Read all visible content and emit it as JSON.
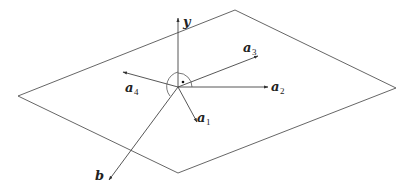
{
  "diagram": {
    "type": "vector-plane-diagram",
    "colors": {
      "line": "#444444",
      "plane": "#555555",
      "text": "#222222"
    },
    "plane": {
      "corners": [
        [
          235,
          10
        ],
        [
          396,
          88
        ],
        [
          178,
          173
        ],
        [
          18,
          96
        ]
      ]
    },
    "origin": [
      178,
      87
    ],
    "vectors": [
      {
        "id": "y",
        "name": "y",
        "subscript": "",
        "end": [
          178,
          18
        ],
        "label_pos": [
          183,
          26
        ]
      },
      {
        "id": "a3",
        "name": "a",
        "subscript": "3",
        "end": [
          258,
          56
        ],
        "label_pos": [
          243,
          52
        ]
      },
      {
        "id": "a2",
        "name": "a",
        "subscript": "2",
        "end": [
          268,
          87
        ],
        "label_pos": [
          271,
          91
        ]
      },
      {
        "id": "a4",
        "name": "a",
        "subscript": "4",
        "end": [
          123,
          72
        ],
        "label_pos": [
          125,
          92
        ]
      },
      {
        "id": "a1",
        "name": "a",
        "subscript": "1",
        "end": [
          197,
          122
        ],
        "label_pos": [
          197,
          122
        ]
      },
      {
        "id": "b",
        "name": "b",
        "subscript": "",
        "end": [
          109,
          180
        ],
        "label_pos": [
          95,
          180
        ]
      }
    ],
    "annotations": {
      "right_angle_dot": [
        183,
        82
      ],
      "angle_arcs": [
        "y-to-a2",
        "y-to-b"
      ]
    }
  }
}
